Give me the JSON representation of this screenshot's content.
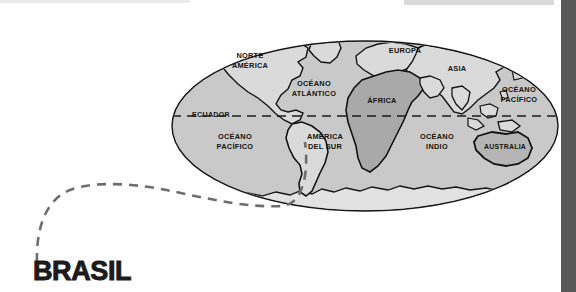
{
  "page": {
    "title": "BRASIL",
    "background_color": "#ffffff",
    "width": 576,
    "height": 292
  },
  "title_block": {
    "label": "BRASIL",
    "color": "#1b1b1b"
  },
  "right_bar": {
    "color": "#575757"
  },
  "world_map": {
    "projection": "ellipse",
    "ocean_color": "#c9c9c9",
    "land_color": "#dadada",
    "africa_color": "#a9a9a9",
    "antarctica_color": "#e2e2e2",
    "outline_color": "#141414",
    "equator_label": "ECUADOR",
    "labels": [
      {
        "text_line1": "NORTE",
        "text_line2": "AMÉRICA",
        "name": "north-america"
      },
      {
        "text_line1": "OCÉANO",
        "text_line2": "ATLÁNTICO",
        "name": "atlantic-ocean"
      },
      {
        "text_line1": "EUROPA",
        "text_line2": "",
        "name": "europe"
      },
      {
        "text_line1": "ASIA",
        "text_line2": "",
        "name": "asia"
      },
      {
        "text_line1": "ÁFRICA",
        "text_line2": "",
        "name": "africa"
      },
      {
        "text_line1": "OCÉANO",
        "text_line2": "PACÍFICO",
        "name": "pacific-ocean-east"
      },
      {
        "text_line1": "OCÉANO",
        "text_line2": "PACÍFICO",
        "name": "pacific-ocean-west"
      },
      {
        "text_line1": "AMÉRICA",
        "text_line2": "DEL SUR",
        "name": "south-america"
      },
      {
        "text_line1": "OCÉANO",
        "text_line2": "INDIO",
        "name": "indian-ocean"
      },
      {
        "text_line1": "AUSTRALIA",
        "text_line2": "",
        "name": "australia"
      }
    ]
  },
  "leader_line": {
    "style": "dashed",
    "color": "#6d6d6d",
    "from": "brasil-title",
    "to": "south-america"
  }
}
